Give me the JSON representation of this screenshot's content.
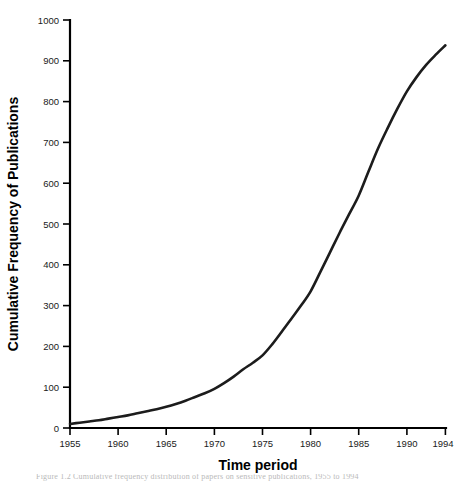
{
  "figure": {
    "background_color": "#ffffff",
    "width": 459,
    "height": 483
  },
  "caption": {
    "text": "Figure 1.2    Cumulative frequency distribution of papers on sensitive publications, 1955 to 1994",
    "color": "#b9b9b9"
  },
  "chart_data": {
    "type": "line",
    "title": "",
    "xlabel": "Time period",
    "ylabel": "Cumulative Frequency of Publications",
    "xlim": [
      1955,
      1994
    ],
    "ylim": [
      0,
      1000
    ],
    "grid": false,
    "legend": null,
    "line_color": "#1c1c1c",
    "line_width": 2.6,
    "xticks": [
      1955,
      1960,
      1965,
      1970,
      1975,
      1980,
      1985,
      1990,
      1994
    ],
    "xtick_labels": [
      "1955",
      "1960",
      "1965",
      "1970",
      "1975",
      "1980",
      "1985",
      "1990",
      "1994"
    ],
    "yticks": [
      0,
      100,
      200,
      300,
      400,
      500,
      600,
      700,
      800,
      900,
      1000
    ],
    "ytick_labels": [
      "0",
      "100",
      "200",
      "300",
      "400",
      "500",
      "600",
      "700",
      "800",
      "900",
      "1000"
    ],
    "x": [
      1955,
      1956,
      1957,
      1958,
      1959,
      1960,
      1961,
      1962,
      1963,
      1964,
      1965,
      1966,
      1967,
      1968,
      1969,
      1970,
      1971,
      1972,
      1973,
      1974,
      1975,
      1976,
      1977,
      1978,
      1979,
      1980,
      1981,
      1982,
      1983,
      1984,
      1985,
      1986,
      1987,
      1988,
      1989,
      1990,
      1991,
      1992,
      1993,
      1994
    ],
    "values": [
      10,
      13,
      16,
      19,
      23,
      27,
      31,
      36,
      41,
      46,
      52,
      59,
      67,
      76,
      85,
      96,
      110,
      126,
      144,
      160,
      178,
      205,
      236,
      268,
      300,
      335,
      382,
      430,
      478,
      524,
      570,
      628,
      685,
      735,
      782,
      825,
      860,
      890,
      915,
      938
    ],
    "series_name": "Cumulative publications",
    "annotations": []
  },
  "axes": {
    "x_axis_label": "Time period",
    "y_axis_label": "Cumulative Frequency of Publications"
  }
}
